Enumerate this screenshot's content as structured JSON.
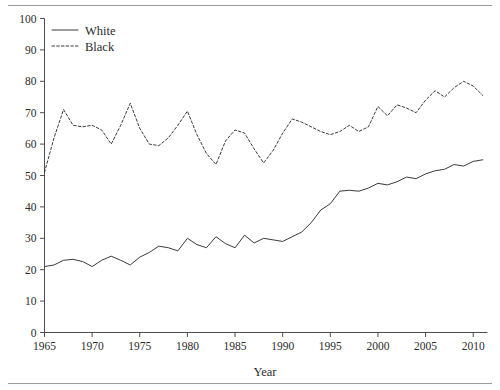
{
  "figure": {
    "has_top_rule": true,
    "has_bottom_rule": true,
    "background_color": "#ffffff",
    "line_color": "#303030"
  },
  "chart_data": {
    "type": "line",
    "title": "",
    "subtitle": "",
    "xlabel": "Year",
    "ylabel": "",
    "xlim": [
      1965,
      2011.5
    ],
    "ylim": [
      0,
      100
    ],
    "grid": false,
    "legend_position": "top-left-inside",
    "xticks": [
      1965,
      1970,
      1975,
      1980,
      1985,
      1990,
      1995,
      2000,
      2005,
      2010
    ],
    "xticklabels": [
      "1965",
      "1970",
      "1975",
      "1980",
      "1985",
      "1990",
      "1995",
      "2000",
      "2005",
      "2010"
    ],
    "yticks": [
      0,
      10,
      20,
      30,
      40,
      50,
      60,
      70,
      80,
      90,
      100
    ],
    "yticklabels": [
      "0",
      "10",
      "20",
      "30",
      "40",
      "50",
      "60",
      "70",
      "80",
      "90",
      "100"
    ],
    "x": [
      1965,
      1966,
      1967,
      1968,
      1969,
      1970,
      1971,
      1972,
      1973,
      1974,
      1975,
      1976,
      1977,
      1978,
      1979,
      1980,
      1981,
      1982,
      1983,
      1984,
      1985,
      1986,
      1987,
      1988,
      1989,
      1990,
      1991,
      1992,
      1993,
      1994,
      1995,
      1996,
      1997,
      1998,
      1999,
      2000,
      2001,
      2002,
      2003,
      2004,
      2005,
      2006,
      2007,
      2008,
      2009,
      2010,
      2011
    ],
    "series": [
      {
        "name": "White",
        "style": "solid",
        "color": "#303030",
        "values": [
          21.0,
          21.5,
          23.0,
          23.3,
          22.6,
          21.0,
          23.0,
          24.3,
          23.0,
          21.5,
          24.0,
          25.5,
          27.5,
          27.0,
          26.0,
          30.0,
          28.0,
          27.0,
          30.5,
          28.3,
          27.0,
          31.0,
          28.5,
          30.0,
          29.5,
          29.0,
          30.5,
          32.0,
          35.0,
          39.0,
          41.0,
          45.0,
          45.3,
          45.0,
          46.0,
          47.5,
          47.0,
          48.0,
          49.5,
          49.0,
          50.5,
          51.5,
          52.0,
          53.5,
          53.0,
          54.5,
          55.0
        ]
      },
      {
        "name": "Black",
        "style": "dashed",
        "color": "#303030",
        "values": [
          51.0,
          62.0,
          71.0,
          66.0,
          65.5,
          66.0,
          64.5,
          60.0,
          66.0,
          73.0,
          65.0,
          60.0,
          59.5,
          62.0,
          66.0,
          70.5,
          63.0,
          57.0,
          53.5,
          61.0,
          64.5,
          63.5,
          58.5,
          54.0,
          58.0,
          63.5,
          68.0,
          67.0,
          65.5,
          64.0,
          63.0,
          64.0,
          66.0,
          64.0,
          65.5,
          72.0,
          69.0,
          72.5,
          71.5,
          70.0,
          74.0,
          77.0,
          75.0,
          78.0,
          80.0,
          78.5,
          75.5
        ]
      }
    ]
  },
  "legend": {
    "entries": [
      {
        "label": "White",
        "style": "solid"
      },
      {
        "label": "Black",
        "style": "dashed"
      }
    ]
  }
}
